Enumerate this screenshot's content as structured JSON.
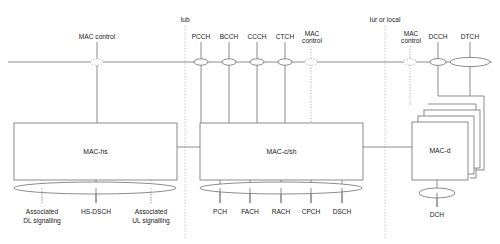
{
  "diagram": {
    "interfaces": [
      {
        "id": "iub",
        "label": "Iub",
        "x": 185
      },
      {
        "id": "iur",
        "label": "Iur or local",
        "x": 385
      }
    ],
    "top_channels": [
      {
        "id": "mac-control-left",
        "label": "MAC control",
        "label_line2": "",
        "x": 97,
        "style": "dotted",
        "ellipse": "small"
      },
      {
        "id": "pcch",
        "label": "PCCH",
        "label_line2": "",
        "x": 201,
        "style": "solid",
        "ellipse": "small"
      },
      {
        "id": "bcch",
        "label": "BCCH",
        "label_line2": "",
        "x": 229,
        "style": "solid",
        "ellipse": "small"
      },
      {
        "id": "ccch",
        "label": "CCCH",
        "label_line2": "",
        "x": 257,
        "style": "solid",
        "ellipse": "small"
      },
      {
        "id": "ctch",
        "label": "CTCH",
        "label_line2": "",
        "x": 285,
        "style": "solid",
        "ellipse": "small"
      },
      {
        "id": "mac-control-mid",
        "label": "MAC",
        "label_line2": "control",
        "x": 311,
        "style": "dotted",
        "ellipse": "small"
      },
      {
        "id": "mac-control-right",
        "label": "MAC",
        "label_line2": "control",
        "x": 410,
        "style": "dotted",
        "ellipse": "small"
      },
      {
        "id": "dcch",
        "label": "DCCH",
        "label_line2": "",
        "x": 438,
        "style": "solid",
        "ellipse": "small"
      },
      {
        "id": "dtch",
        "label": "DTCH",
        "label_line2": "",
        "x": 470,
        "style": "solid",
        "ellipse": "wide"
      }
    ],
    "entities": [
      {
        "id": "mac-hs",
        "label": "MAC-hs",
        "x": 14,
        "y": 123,
        "w": 163,
        "h": 57,
        "stacked": false
      },
      {
        "id": "mac-c-sh",
        "label": "MAC-c/sh",
        "x": 200,
        "y": 123,
        "w": 163,
        "h": 57,
        "stacked": false
      },
      {
        "id": "mac-d",
        "label": "MAC-d",
        "x": 412,
        "y": 122,
        "w": 56,
        "h": 58,
        "stacked": true
      }
    ],
    "transport_groups": [
      {
        "id": "mac-hs-transport",
        "entity": "mac-hs",
        "ellipse": {
          "cx": 95,
          "cy": 188,
          "rx": 81,
          "ry": 6
        },
        "channels": [
          {
            "id": "assoc-dl-signalling",
            "label": "Associated",
            "label_line2": "DL signalling",
            "x": 42,
            "style": "dotted"
          },
          {
            "id": "hs-dsch",
            "label": "HS-DSCH",
            "label_line2": "",
            "x": 96,
            "style": "solid"
          },
          {
            "id": "assoc-ul-signalling",
            "label": "Associated",
            "label_line2": "UL signalling",
            "x": 151,
            "style": "dotted"
          }
        ]
      },
      {
        "id": "mac-c-sh-transport",
        "entity": "mac-c-sh",
        "ellipse": {
          "cx": 281,
          "cy": 188,
          "rx": 81,
          "ry": 6
        },
        "channels": [
          {
            "id": "pch",
            "label": "PCH",
            "label_line2": "",
            "x": 220,
            "style": "solid"
          },
          {
            "id": "fach",
            "label": "FACH",
            "label_line2": "",
            "x": 250,
            "style": "solid"
          },
          {
            "id": "rach",
            "label": "RACH",
            "label_line2": "",
            "x": 281,
            "style": "solid"
          },
          {
            "id": "cpch",
            "label": "CPCH",
            "label_line2": "",
            "x": 311,
            "style": "solid"
          },
          {
            "id": "dsch",
            "label": "DSCH",
            "label_line2": "",
            "x": 342,
            "style": "solid"
          }
        ]
      },
      {
        "id": "mac-d-transport",
        "entity": "mac-d",
        "ellipse": {
          "cx": 437,
          "cy": 193,
          "rx": 18,
          "ry": 5
        },
        "channels": [
          {
            "id": "dch",
            "label": "DCH",
            "label_line2": "",
            "x": 437,
            "style": "solid"
          }
        ]
      }
    ],
    "bus": {
      "y": 62,
      "x1": 8,
      "x2": 492
    }
  }
}
